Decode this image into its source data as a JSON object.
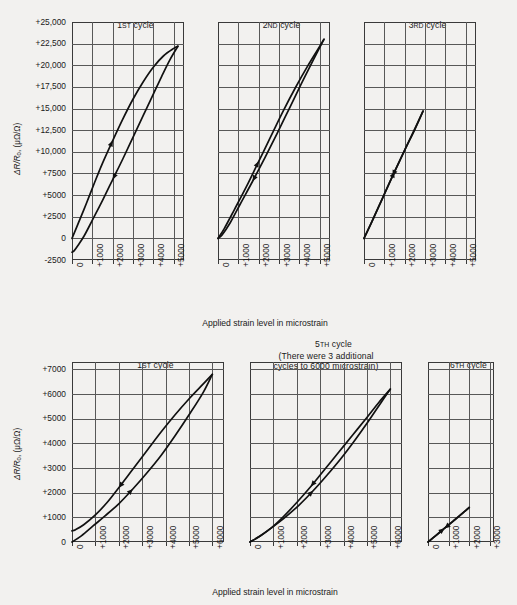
{
  "figure": {
    "background_color": "#f2f1ef",
    "line_color": "#111111",
    "grid_color": "#585858"
  },
  "axis_titles": {
    "x_top": "Applied strain level in microstrain",
    "x_bottom": "Applied strain level in microstrain",
    "y_top_main": "ΔR/R",
    "y_top_sub": "0",
    "y_top_unit": ", (μΩ/Ω)",
    "y_bottom_main": "ΔR/R",
    "y_bottom_sub": "0",
    "y_bottom_unit": ", (μΩ/Ω)"
  },
  "panels": {
    "p1": {
      "title_main": "1",
      "title_sup": "ST",
      "title_rest": " cycle",
      "title_line2": "",
      "title_line3": ""
    },
    "p2": {
      "title_main": "2",
      "title_sup": "ND",
      "title_rest": " cycle",
      "title_line2": "",
      "title_line3": ""
    },
    "p3": {
      "title_main": "3",
      "title_sup": "RD",
      "title_rest": " cycle",
      "title_line2": "",
      "title_line3": ""
    },
    "p4": {
      "title_main": "1",
      "title_sup": "ST",
      "title_rest": " cycle",
      "title_line2": "",
      "title_line3": ""
    },
    "p5": {
      "title_main": "5",
      "title_sup": "TH",
      "title_rest": " cycle",
      "title_line2": "(There were 3 additional",
      "title_line3": "cycles to 6000 microstrain)"
    },
    "p6": {
      "title_main": "6",
      "title_sup": "TH",
      "title_rest": " cycle",
      "title_line2": "",
      "title_line3": ""
    }
  },
  "chart_data": [
    {
      "id": "p1",
      "type": "line",
      "title": "1ST cycle",
      "xlabel": "Applied strain level in microstrain",
      "ylabel": "ΔR/R0, (μΩ/Ω)",
      "xlim": [
        0,
        5500
      ],
      "ylim": [
        -2500,
        25000
      ],
      "xticks": [
        0,
        1000,
        2000,
        3000,
        4000,
        5000
      ],
      "xticklabels": [
        "0",
        "+1000",
        "+2000",
        "+3000",
        "+4000",
        "+5000"
      ],
      "yticks": [
        -2500,
        0,
        2500,
        5000,
        7500,
        10000,
        12500,
        15000,
        17500,
        20000,
        22500,
        25000
      ],
      "yticklabels": [
        "-2500",
        "0",
        "+2500",
        "+5000",
        "+7500",
        "+10,000",
        "+12,500",
        "+15,000",
        "+17,500",
        "+20,000",
        "+22,500",
        "+25,000"
      ],
      "grid": true,
      "series": [
        {
          "name": "loading",
          "direction": "up",
          "points": [
            [
              0,
              0
            ],
            [
              300,
              1700
            ],
            [
              700,
              4000
            ],
            [
              1100,
              6400
            ],
            [
              1500,
              8700
            ],
            [
              2000,
              11300
            ],
            [
              2500,
              13800
            ],
            [
              3000,
              16100
            ],
            [
              3500,
              18100
            ],
            [
              4000,
              19800
            ],
            [
              4500,
              21100
            ],
            [
              5000,
              21950
            ],
            [
              5200,
              22200
            ]
          ]
        },
        {
          "name": "unloading",
          "direction": "down",
          "points": [
            [
              5200,
              22200
            ],
            [
              4800,
              20600
            ],
            [
              4400,
              18700
            ],
            [
              4000,
              16700
            ],
            [
              3500,
              14200
            ],
            [
              3000,
              11700
            ],
            [
              2500,
              9200
            ],
            [
              2000,
              6800
            ],
            [
              1500,
              4400
            ],
            [
              1000,
              2100
            ],
            [
              600,
              300
            ],
            [
              300,
              -800
            ],
            [
              100,
              -1450
            ],
            [
              0,
              -1600
            ]
          ]
        }
      ]
    },
    {
      "id": "p2",
      "type": "line",
      "title": "2ND cycle",
      "xlim": [
        0,
        5500
      ],
      "ylim": [
        -2500,
        25000
      ],
      "xticks": [
        0,
        1000,
        2000,
        3000,
        4000,
        5000
      ],
      "xticklabels": [
        "0",
        "+1000",
        "+2000",
        "+3000",
        "+4000",
        "+5000"
      ],
      "grid": true,
      "series": [
        {
          "name": "loading",
          "direction": "up",
          "points": [
            [
              0,
              0
            ],
            [
              300,
              1100
            ],
            [
              800,
              3300
            ],
            [
              1400,
              6000
            ],
            [
              2000,
              8900
            ],
            [
              2600,
              11800
            ],
            [
              3200,
              14700
            ],
            [
              3800,
              17400
            ],
            [
              4400,
              19900
            ],
            [
              5000,
              22200
            ],
            [
              5200,
              23000
            ]
          ]
        },
        {
          "name": "unloading",
          "direction": "down",
          "points": [
            [
              5200,
              23000
            ],
            [
              4700,
              20700
            ],
            [
              4100,
              17900
            ],
            [
              3500,
              15000
            ],
            [
              2900,
              12100
            ],
            [
              2300,
              9300
            ],
            [
              1700,
              6600
            ],
            [
              1100,
              4000
            ],
            [
              600,
              1800
            ],
            [
              200,
              400
            ],
            [
              0,
              0
            ]
          ]
        }
      ]
    },
    {
      "id": "p3",
      "type": "line",
      "title": "3RD cycle",
      "xlim": [
        0,
        5500
      ],
      "ylim": [
        -2500,
        25000
      ],
      "xticks": [
        0,
        1000,
        2000,
        3000,
        4000,
        5000
      ],
      "xticklabels": [
        "0",
        "+1000",
        "+2000",
        "+3000",
        "+4000",
        "+5000"
      ],
      "grid": true,
      "series": [
        {
          "name": "loading",
          "direction": "up",
          "points": [
            [
              0,
              0
            ],
            [
              500,
              2500
            ],
            [
              1000,
              5100
            ],
            [
              1500,
              7700
            ],
            [
              2000,
              10200
            ],
            [
              2500,
              12600
            ],
            [
              2900,
              14700
            ]
          ]
        },
        {
          "name": "unloading",
          "direction": "down",
          "points": [
            [
              2900,
              14700
            ],
            [
              2400,
              12200
            ],
            [
              1900,
              9700
            ],
            [
              1400,
              7200
            ],
            [
              900,
              4600
            ],
            [
              400,
              2000
            ],
            [
              0,
              0
            ]
          ]
        }
      ]
    },
    {
      "id": "p4",
      "type": "line",
      "title": "1ST cycle",
      "xlabel": "Applied strain level in microstrain",
      "ylabel": "ΔR/R0, (μΩ/Ω)",
      "xlim": [
        0,
        6500
      ],
      "ylim": [
        0,
        7300
      ],
      "xticks": [
        0,
        1000,
        2000,
        3000,
        4000,
        5000,
        6000
      ],
      "xticklabels": [
        "0",
        "+1000",
        "+2000",
        "+3000",
        "+4000",
        "+5000",
        "+6000"
      ],
      "yticks": [
        0,
        1000,
        2000,
        3000,
        4000,
        5000,
        6000,
        7000
      ],
      "yticklabels": [
        "0",
        "+1000",
        "+2000",
        "+3000",
        "+4000",
        "+5000",
        "+6000",
        "+7000"
      ],
      "grid": true,
      "series": [
        {
          "name": "loading",
          "direction": "up",
          "points": [
            [
              0,
              0
            ],
            [
              400,
              250
            ],
            [
              900,
              650
            ],
            [
              1400,
              1050
            ],
            [
              2000,
              1550
            ],
            [
              2600,
              2150
            ],
            [
              3200,
              2800
            ],
            [
              3800,
              3500
            ],
            [
              4400,
              4300
            ],
            [
              5000,
              5150
            ],
            [
              5600,
              6050
            ],
            [
              6000,
              6800
            ]
          ]
        },
        {
          "name": "unloading",
          "direction": "down",
          "points": [
            [
              6000,
              6800
            ],
            [
              5500,
              6300
            ],
            [
              5000,
              5800
            ],
            [
              4400,
              5150
            ],
            [
              3800,
              4450
            ],
            [
              3200,
              3700
            ],
            [
              2600,
              2950
            ],
            [
              2000,
              2200
            ],
            [
              1500,
              1600
            ],
            [
              1000,
              1100
            ],
            [
              500,
              700
            ],
            [
              150,
              500
            ],
            [
              0,
              450
            ]
          ]
        }
      ]
    },
    {
      "id": "p5",
      "type": "line",
      "title": "5TH cycle (There were 3 additional cycles to 6000 microstrain)",
      "xlim": [
        0,
        6500
      ],
      "ylim": [
        0,
        7300
      ],
      "xticks": [
        0,
        1000,
        2000,
        3000,
        4000,
        5000,
        6000
      ],
      "xticklabels": [
        "0",
        "+1000",
        "+2000",
        "+3000",
        "+4000",
        "+5000",
        "+6000"
      ],
      "grid": true,
      "series": [
        {
          "name": "loading",
          "direction": "up",
          "points": [
            [
              0,
              0
            ],
            [
              400,
              220
            ],
            [
              900,
              560
            ],
            [
              1500,
              1000
            ],
            [
              2100,
              1500
            ],
            [
              2700,
              2080
            ],
            [
              3300,
              2720
            ],
            [
              3900,
              3400
            ],
            [
              4500,
              4150
            ],
            [
              5100,
              4950
            ],
            [
              5600,
              5650
            ],
            [
              6000,
              6200
            ]
          ]
        },
        {
          "name": "unloading",
          "direction": "down",
          "points": [
            [
              6000,
              6200
            ],
            [
              5500,
              5650
            ],
            [
              5000,
              5050
            ],
            [
              4400,
              4350
            ],
            [
              3800,
              3650
            ],
            [
              3200,
              2950
            ],
            [
              2600,
              2250
            ],
            [
              2000,
              1600
            ],
            [
              1400,
              1000
            ],
            [
              900,
              560
            ],
            [
              400,
              220
            ],
            [
              0,
              0
            ]
          ]
        }
      ]
    },
    {
      "id": "p6",
      "type": "line",
      "title": "6TH cycle",
      "xlim": [
        0,
        3200
      ],
      "ylim": [
        0,
        7300
      ],
      "xticks": [
        0,
        1000,
        2000,
        3000
      ],
      "xticklabels": [
        "0",
        "+1000",
        "+2000",
        "+3000"
      ],
      "grid": true,
      "series": [
        {
          "name": "loading",
          "direction": "up",
          "points": [
            [
              0,
              0
            ],
            [
              400,
              280
            ],
            [
              800,
              560
            ],
            [
              1200,
              840
            ],
            [
              1600,
              1120
            ],
            [
              2000,
              1400
            ]
          ]
        },
        {
          "name": "unloading",
          "direction": "down",
          "points": [
            [
              2000,
              1400
            ],
            [
              1600,
              1110
            ],
            [
              1200,
              830
            ],
            [
              800,
              550
            ],
            [
              400,
              270
            ],
            [
              0,
              0
            ]
          ]
        }
      ]
    }
  ]
}
